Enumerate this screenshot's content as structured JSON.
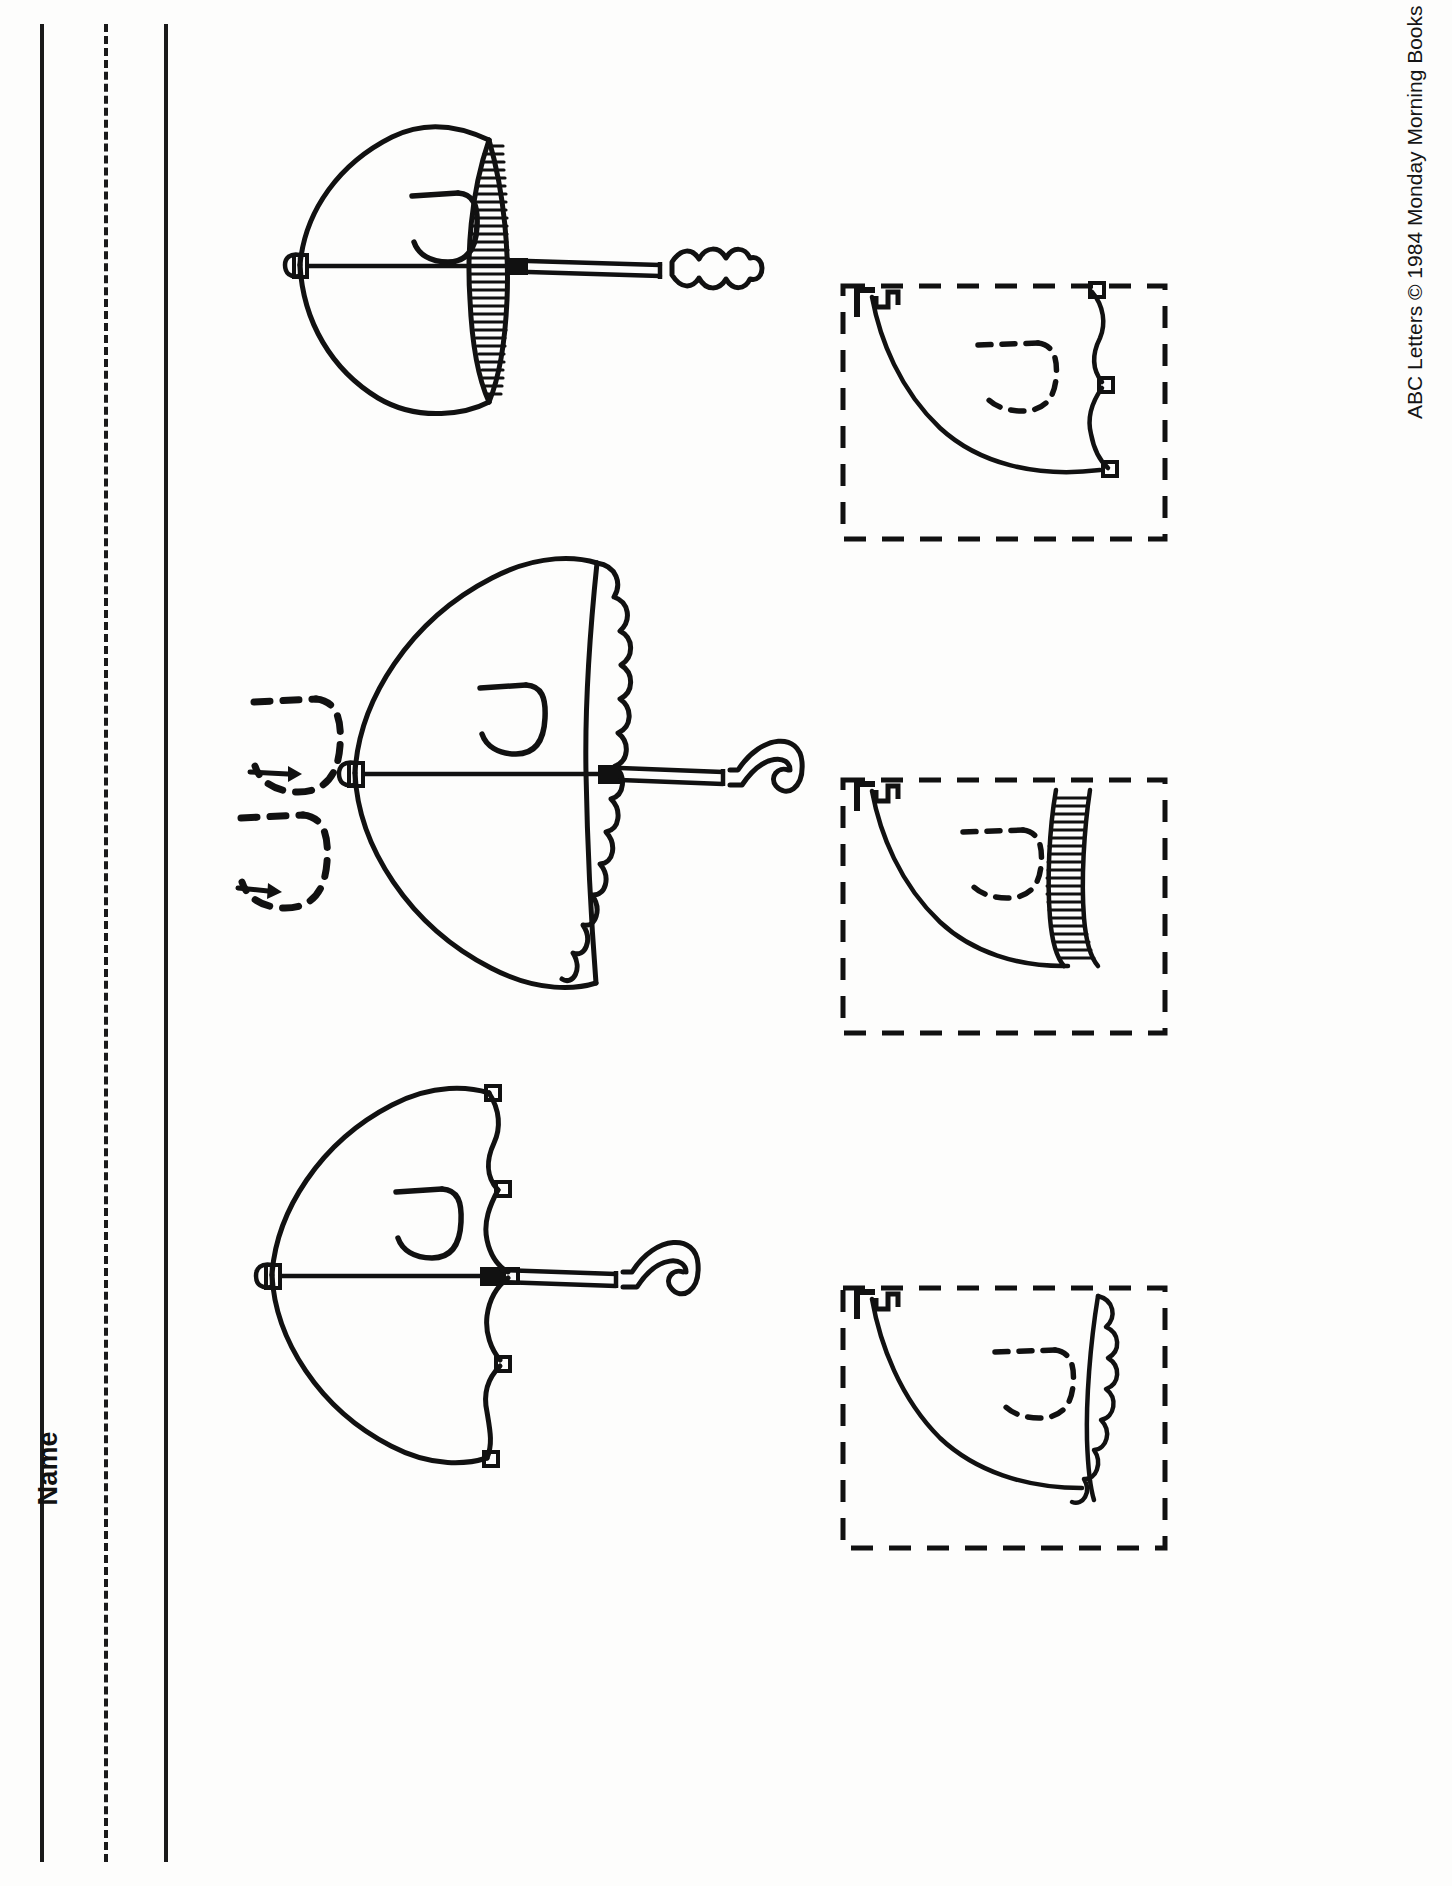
{
  "page": {
    "background_color": "#fdfdfc",
    "ink_color": "#111111",
    "orientation": "rotated-90-ccw",
    "width": 1452,
    "height": 1886
  },
  "name_field": {
    "label": "Name",
    "line_count": 3,
    "line_styles": [
      "solid",
      "dashed",
      "solid"
    ]
  },
  "copyright": {
    "text": "ABC Letters © 1984 Monday Morning Books",
    "publisher": "Monday Morning Books",
    "year": "1984",
    "series": "ABC Letters",
    "symbol": "©"
  },
  "letter": {
    "target": "J",
    "case": "uppercase",
    "theme_word": "umbrella"
  },
  "practice_strokes": {
    "count": 2,
    "style": "dashed",
    "letter": "J",
    "arrow_count": 2,
    "arrow_direction": "right",
    "description": "two dashed trace-letter J guides with stroke-direction arrows"
  },
  "umbrellas": [
    {
      "index": 1,
      "position": "top",
      "canopy_edge": "striped",
      "handle": "scalloped-knob",
      "letter_on_canopy": "J",
      "tip_shape": "small-knob",
      "shaft": "straight"
    },
    {
      "index": 2,
      "position": "middle",
      "canopy_edge": "scalloped-round",
      "handle": "hook",
      "letter_on_canopy": "J",
      "tip_shape": "small-knob",
      "shaft": "straight"
    },
    {
      "index": 3,
      "position": "bottom",
      "canopy_edge": "scalloped-pointed",
      "handle": "hook",
      "letter_on_canopy": "J",
      "tip_shape": "small-knob",
      "shaft": "straight"
    }
  ],
  "cut_boxes": [
    {
      "index": 1,
      "position": "top-right",
      "border": "dashed",
      "contents": "umbrella half-canopy with scalloped edge and dashed letter J",
      "edge_style": "scalloped-pointed",
      "dashed_letter": "J"
    },
    {
      "index": 2,
      "position": "middle-right",
      "border": "dashed",
      "contents": "umbrella half-canopy with striped edge and dashed letter J",
      "edge_style": "striped",
      "dashed_letter": "J"
    },
    {
      "index": 3,
      "position": "bottom-right",
      "border": "dashed",
      "contents": "umbrella half-canopy with round scalloped edge and dashed letter J",
      "edge_style": "scalloped-round",
      "dashed_letter": "J"
    }
  ]
}
